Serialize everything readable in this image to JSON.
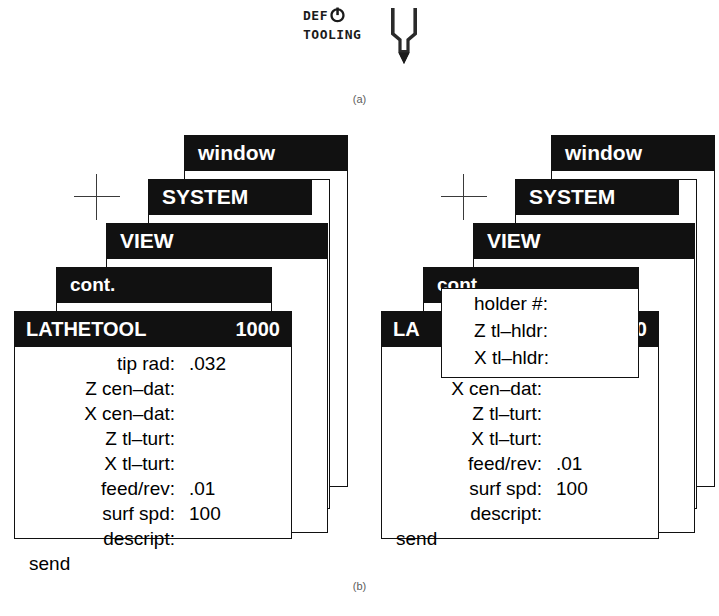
{
  "figure_a": {
    "logo": {
      "line1": "DEF",
      "line2": "TOOLING",
      "power_icon": "power-icon",
      "tool_icon": "lathe-tool-tip-icon"
    },
    "caption": "(a)"
  },
  "figure_b": {
    "caption": "(b)",
    "titlebars": {
      "window": "window",
      "system": "SYSTEM",
      "view": "VIEW",
      "cont": "cont.",
      "lathetool": "LATHETOOL",
      "lathetool_value": "1000",
      "lathetool_clipped_left": "LA",
      "lathetool_clipped_right": "00"
    },
    "left_panel": {
      "fields": [
        {
          "label": "tip rad:",
          "value": ".032"
        },
        {
          "label": "Z cen–dat:",
          "value": ""
        },
        {
          "label": "X cen–dat:",
          "value": ""
        },
        {
          "label": "Z    tl–turt:",
          "value": ""
        },
        {
          "label": "X    tl–turt:",
          "value": ""
        },
        {
          "label": "feed/rev:",
          "value": ".01"
        },
        {
          "label": "surf spd:",
          "value": "100"
        },
        {
          "label": "descript:",
          "value": ""
        }
      ],
      "send_label": "send"
    },
    "right_panel": {
      "holder_dialog": {
        "rows": [
          "holder #:",
          "Z tl–hldr:",
          "X tl–hldr:"
        ]
      },
      "fields": [
        {
          "label": "Z cen–dat:",
          "value": ""
        },
        {
          "label": "X cen–dat:",
          "value": ""
        },
        {
          "label": "Z    tl–turt:",
          "value": ""
        },
        {
          "label": "X    tl–turt:",
          "value": ""
        },
        {
          "label": "feed/rev:",
          "value": ".01"
        },
        {
          "label": "surf spd:",
          "value": "100"
        },
        {
          "label": "descript:",
          "value": ""
        }
      ],
      "send_label": "send"
    }
  },
  "colors": {
    "titlebar_bg": "#111111",
    "titlebar_text": "#ffffff",
    "body_bg": "#ffffff",
    "border": "#111111",
    "caption_text": "#5d5d5d"
  }
}
